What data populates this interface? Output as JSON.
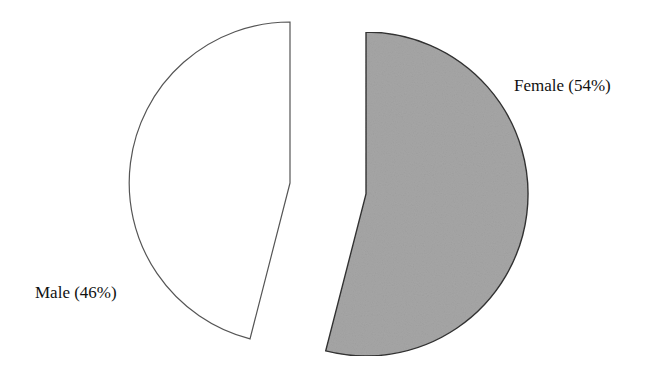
{
  "chart_data": {
    "type": "pie",
    "exploded": true,
    "categories": [
      "Female",
      "Male"
    ],
    "values": [
      54,
      46
    ],
    "labels": [
      "Female (54%)",
      "Male (46%)"
    ],
    "colors": {
      "Female": "#a6a6a6",
      "Male": "#ffffff"
    },
    "title": "",
    "legend": "none"
  },
  "labels": {
    "female": "Female (54%)",
    "male": "Male (46%)"
  }
}
